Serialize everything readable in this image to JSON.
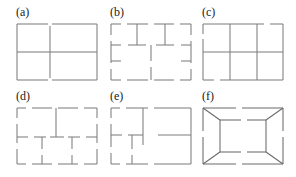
{
  "figure": {
    "background_color": "#ffffff",
    "line_color": "#7d7d7d",
    "label_color": "#1a1a1a",
    "panel_columns": 3,
    "panel_rows": 2,
    "panels": [
      {
        "id": "a",
        "label": "(a)",
        "description": "rectangle outline with small gaps, full interior vertical midline and interior horizontal line forming a cross",
        "row": 0,
        "column": 0
      },
      {
        "id": "b",
        "label": "(b)",
        "description": "rectangle with broken outline, two interior vertical stubs from top, two T junctions, short central vertical stub",
        "row": 0,
        "column": 1
      },
      {
        "id": "c",
        "label": "(c)",
        "description": "rectangle divided into three columns and two rows with two plus-shaped crossings",
        "row": 0,
        "column": 2
      },
      {
        "id": "d",
        "label": "(d)",
        "description": "heavily fragmented rectangle grid with dashed outline, three interior vertical stubs and dashed horizontal midline",
        "row": 1,
        "column": 0
      },
      {
        "id": "e",
        "label": "(e)",
        "description": "rectangle with broken outline, one full interior vertical line, a horizontal stub and a short lower vertical stub",
        "row": 1,
        "column": 1
      },
      {
        "id": "f",
        "label": "(f)",
        "description": "nested rectangle inside outer rectangle connected by four corner diagonals forming a perspective tunnel",
        "row": 1,
        "column": 2
      }
    ]
  }
}
